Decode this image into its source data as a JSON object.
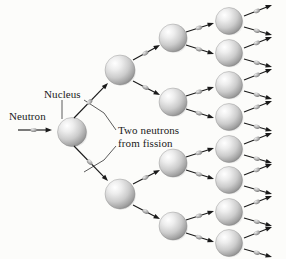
{
  "figure": {
    "background_color": "#fcfcfa",
    "width": 286,
    "height": 259
  },
  "labels": {
    "neutron": "Neutron",
    "nucleus": "Nucleus",
    "two_neutrons_line1": "Two neutrons",
    "two_neutrons_line2": "from fission",
    "two_neutrons": "Two neutrons\nfrom fission"
  },
  "colors": {
    "sphere_light": "#ffffff",
    "sphere_mid": "#c9c9c9",
    "sphere_dark": "#8a8a8a",
    "sphere_edge": "#7d7d7d",
    "arrow": "#1a1a1a",
    "neutron_blob": "#9a9a9a",
    "leader_line": "#4a4a4a",
    "text": "#1a1a1a"
  },
  "chart_data": {
    "type": "diagram",
    "generations": 4,
    "neutrons_per_fission": 2,
    "sphere_counts": [
      1,
      2,
      4,
      8
    ],
    "spheres": [
      {
        "gen": 1,
        "id": "g1-0",
        "cx": 72,
        "cy": 132,
        "r": 14.5
      },
      {
        "gen": 2,
        "id": "g2-0",
        "cx": 120,
        "cy": 70,
        "r": 15
      },
      {
        "gen": 2,
        "id": "g2-1",
        "cx": 120,
        "cy": 194,
        "r": 15
      },
      {
        "gen": 3,
        "id": "g3-0",
        "cx": 173,
        "cy": 38,
        "r": 14
      },
      {
        "gen": 3,
        "id": "g3-1",
        "cx": 173,
        "cy": 102,
        "r": 14
      },
      {
        "gen": 3,
        "id": "g3-2",
        "cx": 173,
        "cy": 163,
        "r": 14
      },
      {
        "gen": 3,
        "id": "g3-3",
        "cx": 173,
        "cy": 226,
        "r": 14
      },
      {
        "gen": 4,
        "id": "g4-0",
        "cx": 229,
        "cy": 21,
        "r": 13.5
      },
      {
        "gen": 4,
        "id": "g4-1",
        "cx": 229,
        "cy": 53,
        "r": 13.5
      },
      {
        "gen": 4,
        "id": "g4-2",
        "cx": 229,
        "cy": 85,
        "r": 13.5
      },
      {
        "gen": 4,
        "id": "g4-3",
        "cx": 229,
        "cy": 117,
        "r": 13.5
      },
      {
        "gen": 4,
        "id": "g4-4",
        "cx": 229,
        "cy": 149,
        "r": 13.5
      },
      {
        "gen": 4,
        "id": "g4-5",
        "cx": 229,
        "cy": 180,
        "r": 13.5
      },
      {
        "gen": 4,
        "id": "g4-6",
        "cx": 229,
        "cy": 212,
        "r": 13.5
      },
      {
        "gen": 4,
        "id": "g4-7",
        "cx": 229,
        "cy": 243,
        "r": 13.5
      }
    ],
    "neutron_arrows": [
      {
        "id": "n-in",
        "x1": 18,
        "y1": 130,
        "x2": 52,
        "y2": 130
      },
      {
        "id": "n-g1-a",
        "x1": 74,
        "y1": 118,
        "x2": 108,
        "y2": 83
      },
      {
        "id": "n-g1-b",
        "x1": 74,
        "y1": 146,
        "x2": 108,
        "y2": 181
      },
      {
        "id": "n-g2-0a",
        "x1": 133,
        "y1": 60,
        "x2": 160,
        "y2": 45
      },
      {
        "id": "n-g2-0b",
        "x1": 133,
        "y1": 81,
        "x2": 160,
        "y2": 95
      },
      {
        "id": "n-g2-1a",
        "x1": 133,
        "y1": 184,
        "x2": 160,
        "y2": 170
      },
      {
        "id": "n-g2-1b",
        "x1": 133,
        "y1": 205,
        "x2": 160,
        "y2": 219
      },
      {
        "id": "n-g3-0a",
        "x1": 186,
        "y1": 32,
        "x2": 214,
        "y2": 23
      },
      {
        "id": "n-g3-0b",
        "x1": 186,
        "y1": 45,
        "x2": 214,
        "y2": 54
      },
      {
        "id": "n-g3-1a",
        "x1": 186,
        "y1": 96,
        "x2": 214,
        "y2": 87
      },
      {
        "id": "n-g3-1b",
        "x1": 186,
        "y1": 109,
        "x2": 214,
        "y2": 118
      },
      {
        "id": "n-g3-2a",
        "x1": 186,
        "y1": 157,
        "x2": 214,
        "y2": 148
      },
      {
        "id": "n-g3-2b",
        "x1": 186,
        "y1": 170,
        "x2": 214,
        "y2": 179
      },
      {
        "id": "n-g3-3a",
        "x1": 186,
        "y1": 220,
        "x2": 214,
        "y2": 211
      },
      {
        "id": "n-g3-3b",
        "x1": 186,
        "y1": 233,
        "x2": 214,
        "y2": 242
      },
      {
        "id": "n-g4-0a",
        "x1": 244,
        "y1": 16,
        "x2": 272,
        "y2": 5
      },
      {
        "id": "n-g4-0b",
        "x1": 244,
        "y1": 27,
        "x2": 272,
        "y2": 35
      },
      {
        "id": "n-g4-1a",
        "x1": 244,
        "y1": 48,
        "x2": 272,
        "y2": 37
      },
      {
        "id": "n-g4-1b",
        "x1": 244,
        "y1": 59,
        "x2": 272,
        "y2": 67
      },
      {
        "id": "n-g4-2a",
        "x1": 244,
        "y1": 80,
        "x2": 272,
        "y2": 69
      },
      {
        "id": "n-g4-2b",
        "x1": 244,
        "y1": 91,
        "x2": 272,
        "y2": 99
      },
      {
        "id": "n-g4-3a",
        "x1": 244,
        "y1": 112,
        "x2": 272,
        "y2": 101
      },
      {
        "id": "n-g4-3b",
        "x1": 244,
        "y1": 123,
        "x2": 272,
        "y2": 131
      },
      {
        "id": "n-g4-4a",
        "x1": 244,
        "y1": 144,
        "x2": 272,
        "y2": 133
      },
      {
        "id": "n-g4-4b",
        "x1": 244,
        "y1": 155,
        "x2": 272,
        "y2": 163
      },
      {
        "id": "n-g4-5a",
        "x1": 244,
        "y1": 175,
        "x2": 272,
        "y2": 164
      },
      {
        "id": "n-g4-5b",
        "x1": 244,
        "y1": 186,
        "x2": 272,
        "y2": 194
      },
      {
        "id": "n-g4-6a",
        "x1": 244,
        "y1": 207,
        "x2": 272,
        "y2": 196
      },
      {
        "id": "n-g4-6b",
        "x1": 244,
        "y1": 218,
        "x2": 272,
        "y2": 226
      },
      {
        "id": "n-g4-7a",
        "x1": 244,
        "y1": 238,
        "x2": 272,
        "y2": 227
      },
      {
        "id": "n-g4-7b",
        "x1": 244,
        "y1": 249,
        "x2": 272,
        "y2": 257
      }
    ],
    "leader_lines": [
      {
        "id": "leader-nucleus",
        "points": "62,100 62,119"
      },
      {
        "id": "leader-two-neutrons-upper",
        "points": "116,130 104,113 84,100"
      },
      {
        "id": "leader-two-neutrons-lower",
        "points": "116,146 104,160 84,172"
      }
    ]
  }
}
